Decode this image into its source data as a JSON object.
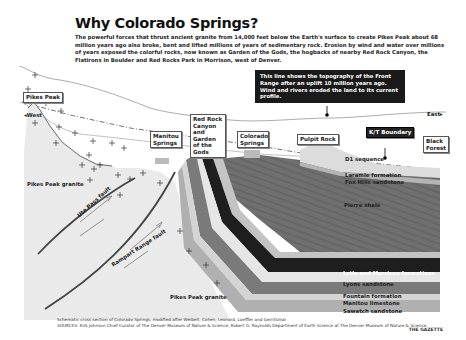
{
  "header": {
    "title": "Why Colorado Springs?",
    "intro": "The powerful forces that thrust ancient granite from 14,000 feet below the Earth's surface to create Pikes Peak about 68 million years ago also broke, bent and lifted millions of years of sedimentary rock. Erosion by wind and water over millions of years exposed the colorful rocks, now known as Garden of the Gods, the hogbacks of nearby Red Rock Canyon, the Flatirons in Boulder and Red Rocks Park in Morrison, west of Denver."
  },
  "callout": {
    "text": "This line shows the topography of the Front Range after an uplift 10 million years ago. Wind and rivers eroded the land to its current profile."
  },
  "directions": {
    "west": "West",
    "east": "East"
  },
  "place_labels": {
    "pikes_peak": "Pikes Peak",
    "manitou_springs": "Manitou Springs",
    "red_rock_canyon": "Red Rock Canyon and Garden of the Gods",
    "colorado_springs": "Colorado Springs",
    "pulpit_rock": "Pulpit Rock",
    "kt_boundary": "K/T Boundary",
    "black_forest": "Black Forest"
  },
  "granite_labels": {
    "upper": "Pikes Peak granite",
    "lower": "Pikes Peak granite"
  },
  "faults": {
    "ute_pass": "Ute Pass fault",
    "rampart_range": "Rampart Range fault"
  },
  "layers": [
    {
      "name": "D1 sequence",
      "color": "#d8d8d8"
    },
    {
      "name": "Laramie formation",
      "color": "#b8b8b8"
    },
    {
      "name": "Fox Hills sandstone",
      "color": "#a8a8a8"
    },
    {
      "name": "Pierre shale",
      "color": "#6e6e6e"
    },
    {
      "name": "Dakota sandstone",
      "color": "#c4c4c4"
    },
    {
      "name": "Lytle and Morrison formations",
      "color": "#1e1e1e"
    },
    {
      "name": "Lyons sandstone",
      "color": "#e6e6e6"
    },
    {
      "name": "Fountain formation",
      "color": "#7a7a7a"
    },
    {
      "name": "Manitou limestone",
      "color": "#cfcfcf"
    },
    {
      "name": "Sawatch sandstone",
      "color": "#b0b0b0"
    }
  ],
  "footer": {
    "schematic": "Schematic cross section of Colorado Springs, modified after Weibelt, Cohen, Leonard, Loeffler and Gerritsmar",
    "sources": "SOURCES: Kirk Johnson Chief Curator of The Denver Museum of Nature & Science, Robert G. Raynolds Department of Earth Science at The Denver Museum of Nature & Science.",
    "credit": "THE GAZETTE"
  }
}
